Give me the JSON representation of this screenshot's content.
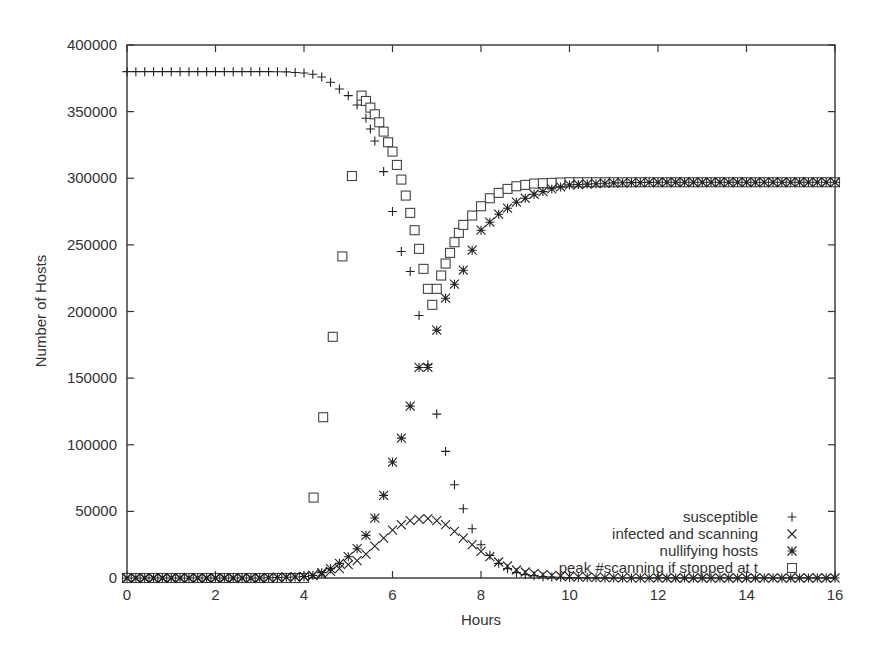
{
  "chart_data": {
    "type": "scatter",
    "title": "",
    "xlabel": "Hours",
    "ylabel": "Number of Hosts",
    "xlim": [
      0,
      16
    ],
    "ylim": [
      0,
      400000
    ],
    "xticks": [
      0,
      2,
      4,
      6,
      8,
      10,
      12,
      14,
      16
    ],
    "yticks": [
      0,
      50000,
      100000,
      150000,
      200000,
      250000,
      300000,
      350000,
      400000
    ],
    "grid": false,
    "legend_position": "lower right",
    "series": [
      {
        "name": "susceptible",
        "marker": "+",
        "x": [
          0,
          0.4,
          0.8,
          1.2,
          1.6,
          2.0,
          2.4,
          2.8,
          3.2,
          3.6,
          4.0,
          4.2,
          4.4,
          4.6,
          4.8,
          5.0,
          5.2,
          5.4,
          5.5,
          5.6,
          5.8,
          6.0,
          6.2,
          6.4,
          6.6,
          6.8,
          7.0,
          7.2,
          7.4,
          7.6,
          7.8,
          8.0,
          8.2,
          8.4,
          8.6,
          8.8,
          9.0,
          9.4,
          10,
          11,
          12,
          13,
          14,
          15,
          16
        ],
        "y": [
          380000,
          380000,
          380000,
          380000,
          380000,
          380000,
          380000,
          380000,
          380000,
          379800,
          379000,
          378000,
          376000,
          372000,
          367000,
          362000,
          355000,
          345000,
          337000,
          328000,
          305000,
          275000,
          245000,
          230000,
          197000,
          160000,
          123000,
          95000,
          70000,
          52000,
          37000,
          25000,
          17000,
          11000,
          7000,
          4000,
          2500,
          1000,
          300,
          0,
          0,
          0,
          0,
          0,
          0
        ]
      },
      {
        "name": "infected and scanning",
        "marker": "x",
        "x": [
          0,
          1,
          2,
          3,
          4.0,
          4.2,
          4.4,
          4.6,
          4.8,
          5.0,
          5.2,
          5.4,
          5.6,
          5.8,
          6.0,
          6.2,
          6.4,
          6.6,
          6.8,
          7.0,
          7.2,
          7.4,
          7.6,
          7.8,
          8.0,
          8.2,
          8.4,
          8.6,
          8.8,
          9.0,
          9.4,
          10,
          11,
          12,
          13,
          14,
          15,
          16
        ],
        "y": [
          0,
          0,
          0,
          0,
          1000,
          2000,
          3000,
          5000,
          7000,
          10000,
          13000,
          18000,
          24000,
          30000,
          36000,
          40000,
          43000,
          44000,
          44500,
          43000,
          40000,
          35000,
          30000,
          25000,
          20000,
          16000,
          12000,
          9000,
          6000,
          4500,
          2500,
          1000,
          200,
          0,
          0,
          0,
          0,
          0
        ]
      },
      {
        "name": "nullifying hosts",
        "marker": "*",
        "x": [
          0,
          1,
          2,
          3,
          4.0,
          4.2,
          4.4,
          4.6,
          4.8,
          5.0,
          5.2,
          5.4,
          5.6,
          5.8,
          6.0,
          6.2,
          6.4,
          6.6,
          6.8,
          7.0,
          7.2,
          7.6,
          8.0,
          8.4,
          8.8,
          9.2,
          9.6,
          10,
          11,
          12,
          13,
          14,
          15,
          16
        ],
        "y": [
          0,
          0,
          0,
          0,
          1000,
          2000,
          4000,
          7000,
          11000,
          16000,
          22000,
          32000,
          45000,
          62000,
          87000,
          105000,
          129000,
          158000,
          158000,
          186000,
          210000,
          231000,
          261000,
          273000,
          282000,
          288000,
          292000,
          295000,
          296500,
          297000,
          297000,
          297000,
          297000,
          297000
        ]
      },
      {
        "name": "peak #scanning if stopped at t",
        "marker": "square",
        "x": [
          0,
          1,
          2,
          3,
          4.0,
          5.3,
          5.4,
          5.5,
          5.6,
          5.7,
          5.8,
          5.9,
          6.0,
          6.1,
          6.2,
          6.3,
          6.4,
          6.5,
          6.6,
          6.7,
          6.8,
          6.9,
          7.0,
          7.1,
          7.2,
          7.3,
          7.4,
          7.5,
          7.6,
          7.8,
          8.0,
          8.2,
          8.4,
          8.6,
          8.8,
          9.2,
          9.6,
          10,
          11,
          12,
          13,
          14,
          15,
          16
        ],
        "y": [
          0,
          0,
          0,
          0,
          0,
          362000,
          358000,
          353000,
          348000,
          342000,
          335000,
          327000,
          320000,
          310000,
          299000,
          287000,
          274000,
          261000,
          247000,
          232000,
          217000,
          205000,
          217000,
          227000,
          236000,
          244000,
          252000,
          259000,
          265000,
          272000,
          279000,
          285000,
          289000,
          292000,
          294000,
          296000,
          296500,
          297000,
          297000,
          297000,
          297000,
          297000,
          297000,
          297000
        ]
      }
    ]
  },
  "axes": {
    "x_title": "Hours",
    "y_title": "Number of Hosts",
    "x_tick_labels": [
      "0",
      "2",
      "4",
      "6",
      "8",
      "10",
      "12",
      "14",
      "16"
    ],
    "y_tick_labels": [
      "0",
      "50000",
      "100000",
      "150000",
      "200000",
      "250000",
      "300000",
      "350000",
      "400000"
    ]
  },
  "legend": {
    "items": [
      {
        "label": "susceptible",
        "marker": "+"
      },
      {
        "label": "infected and scanning",
        "marker": "x"
      },
      {
        "label": "nullifying hosts",
        "marker": "*"
      },
      {
        "label": "peak #scanning if stopped at t",
        "marker": "square"
      }
    ]
  },
  "colors": {
    "axis": "#333333",
    "marker": "#222222",
    "background": "#ffffff"
  }
}
